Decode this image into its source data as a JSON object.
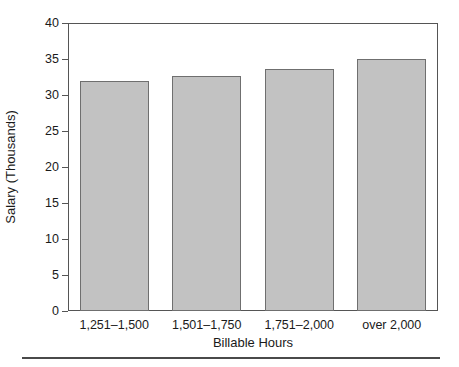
{
  "chart_data": {
    "type": "bar",
    "title": "",
    "xlabel": "Billable Hours",
    "ylabel": "Salary (Thousands)",
    "categories": [
      "1,251–1,500",
      "1,501–1,750",
      "1,751–2,000",
      "over 2,000"
    ],
    "values": [
      32.0,
      32.6,
      33.6,
      35.0
    ],
    "ylim": [
      0,
      40
    ],
    "yticks": [
      0,
      5,
      10,
      15,
      20,
      25,
      30,
      35,
      40
    ],
    "ytick_labels": [
      "0",
      "5",
      "10",
      "15",
      "20",
      "25",
      "30",
      "35",
      "40"
    ],
    "grid": false,
    "legend": null,
    "bar_fill_color": "#c2c2c2",
    "bar_edge_color": "#6f6f6f",
    "axis_color": "#555555",
    "text_color": "#1a1a1a"
  },
  "figure": {
    "x_axis_title": "Billable Hours",
    "y_axis_title": "Salary (Thousands)"
  }
}
